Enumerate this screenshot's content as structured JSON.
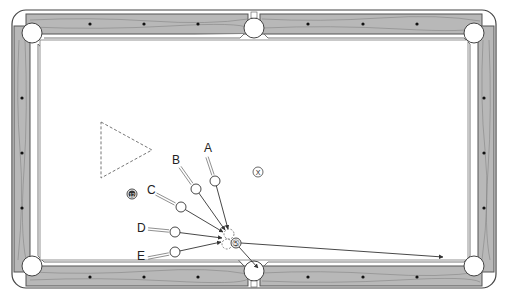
{
  "diagram": {
    "type": "pool-table-shot-diagram",
    "colors": {
      "rail_wood": "#b8b8b8",
      "rail_dark": "#555555",
      "cloth": "#ffffff",
      "line": "#333333",
      "pocket": "#ffffff"
    },
    "table": {
      "outer": {
        "x": 12,
        "y": 10,
        "w": 484,
        "h": 278
      },
      "pockets": [
        {
          "name": "top-left",
          "cx": 32,
          "cy": 33,
          "r": 10
        },
        {
          "name": "top-middle",
          "cx": 254,
          "cy": 28,
          "r": 10
        },
        {
          "name": "top-right",
          "cx": 474,
          "cy": 33,
          "r": 10
        },
        {
          "name": "bottom-left",
          "cx": 32,
          "cy": 266,
          "r": 10
        },
        {
          "name": "bottom-middle",
          "cx": 254,
          "cy": 271,
          "r": 10
        },
        {
          "name": "bottom-right",
          "cx": 474,
          "cy": 266,
          "r": 10
        }
      ],
      "diamonds": {
        "top": [
          [
            90,
            24
          ],
          [
            144,
            24
          ],
          [
            198,
            24
          ],
          [
            308,
            24
          ],
          [
            363,
            24
          ],
          [
            417,
            24
          ]
        ],
        "bottom": [
          [
            90,
            277
          ],
          [
            144,
            277
          ],
          [
            198,
            277
          ],
          [
            308,
            277
          ],
          [
            363,
            277
          ],
          [
            417,
            277
          ]
        ],
        "left": [
          [
            22,
            98
          ],
          [
            22,
            153
          ],
          [
            22,
            208
          ]
        ],
        "right": [
          [
            484,
            98
          ],
          [
            484,
            153
          ],
          [
            484,
            208
          ]
        ]
      }
    },
    "rack_triangle": {
      "points": [
        [
          101,
          122
        ],
        [
          152,
          150
        ],
        [
          101,
          178
        ]
      ],
      "style": "dashed"
    },
    "balls": {
      "object_ball": {
        "label": "5",
        "cx": 236,
        "cy": 243,
        "r": 5
      },
      "blocker_ball": {
        "label": "12",
        "cx": 132,
        "cy": 194,
        "r": 5
      },
      "x_marker": {
        "label": "X",
        "cx": 258,
        "cy": 172,
        "r": 5
      },
      "cue_positions": [
        {
          "label": "A",
          "cx": 215,
          "cy": 181,
          "label_x": 204,
          "label_y": 152,
          "cue_from": [
            207,
            157
          ],
          "cue_to": [
            213,
            175
          ]
        },
        {
          "label": "B",
          "cx": 196,
          "cy": 189,
          "label_x": 172,
          "label_y": 164,
          "cue_from": [
            180,
            167
          ],
          "cue_to": [
            192,
            184
          ]
        },
        {
          "label": "C",
          "cx": 181,
          "cy": 207,
          "label_x": 147,
          "label_y": 194,
          "cue_from": [
            156,
            194
          ],
          "cue_to": [
            175,
            204
          ]
        },
        {
          "label": "D",
          "cx": 175,
          "cy": 232,
          "label_x": 137,
          "label_y": 232,
          "cue_from": [
            148,
            229
          ],
          "cue_to": [
            169,
            231
          ]
        },
        {
          "label": "E",
          "cx": 175,
          "cy": 252,
          "label_x": 137,
          "label_y": 260,
          "cue_from": [
            148,
            258
          ],
          "cue_to": [
            169,
            254
          ]
        }
      ],
      "ghost_balls": [
        {
          "cx": 229,
          "cy": 234,
          "r": 5
        },
        {
          "cx": 227,
          "cy": 244,
          "r": 5
        }
      ]
    },
    "paths": {
      "cue_to_ghost": [
        {
          "from": "A",
          "to": [
            228,
            229
          ]
        },
        {
          "from": "B",
          "to": [
            225,
            230
          ]
        },
        {
          "from": "C",
          "to": [
            223,
            232
          ]
        },
        {
          "from": "D",
          "to": [
            222,
            238
          ]
        },
        {
          "from": "E",
          "to": [
            221,
            242
          ]
        }
      ],
      "object_to_pocket": {
        "from": [
          239,
          247
        ],
        "to": [
          258,
          268
        ]
      },
      "cue_ball_after": {
        "from": [
          241,
          243
        ],
        "to": [
          443,
          257
        ]
      }
    }
  }
}
